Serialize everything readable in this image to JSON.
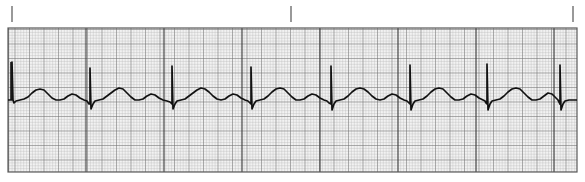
{
  "page": {
    "width": 585,
    "height": 182,
    "background_color": "#ffffff"
  },
  "strip": {
    "label": "ecg-rhythm-strip",
    "grid": {
      "x": 8,
      "y": 28,
      "width": 569,
      "height": 144,
      "paper_color": "#f2f2f2",
      "small_square_px": 2.9,
      "bold_every": 5,
      "minor_line_color": "#b4b4b4",
      "bold_line_color": "#6e6e6e",
      "major_line_color": "#3c3c3c",
      "major_every_px": 78,
      "border_color": "#5a5a5a"
    },
    "interval_ticks": {
      "label": "three-second-interval-ticks",
      "color": "#555555",
      "y_top": 6,
      "y_bottom": 22,
      "x_positions": [
        12,
        291,
        573
      ]
    },
    "trace": {
      "label": "ecg-waveform-trace",
      "color": "#111111",
      "stroke_width": 1.7,
      "baseline_y": 100,
      "calibration_mark": {
        "x": 11,
        "y_top": 62,
        "y_bottom": 100
      }
    }
  },
  "chart_data": {
    "type": "line",
    "xlabel": "Time",
    "ylabel": "Amplitude (mV)",
    "grid": true,
    "legend": null,
    "annotations": [
      "three-second interval ticks at x = 12, 291, 573"
    ],
    "x_range_px": [
      8,
      577
    ],
    "y_range_px": [
      28,
      172
    ],
    "baseline_y_px": 100,
    "beat_count": 8,
    "beat_interval_px": 78,
    "qrs_peak_x_px": [
      12,
      90,
      172,
      251,
      331,
      410,
      487,
      560
    ],
    "beat_template_px": {
      "q_dip_y": 104,
      "r_peak_y": 68,
      "s_trough_y": 109,
      "t_peak_y": 88,
      "u_peak_y": 93,
      "p_peak_y": 96
    },
    "series": [
      {
        "name": "Lead II",
        "points_px": [
          [
            8,
            100
          ],
          [
            9,
            100
          ],
          [
            10,
            100
          ],
          [
            11,
            100
          ],
          [
            12,
            100
          ],
          [
            12,
            62
          ],
          [
            13,
            100
          ],
          [
            14,
            103
          ],
          [
            16,
            101
          ],
          [
            20,
            100
          ],
          [
            24,
            99
          ],
          [
            28,
            97
          ],
          [
            32,
            93
          ],
          [
            36,
            90
          ],
          [
            40,
            89
          ],
          [
            44,
            90
          ],
          [
            48,
            94
          ],
          [
            52,
            98
          ],
          [
            56,
            100
          ],
          [
            60,
            100
          ],
          [
            64,
            99
          ],
          [
            68,
            96
          ],
          [
            72,
            94
          ],
          [
            76,
            95
          ],
          [
            80,
            98
          ],
          [
            84,
            100
          ],
          [
            87,
            101
          ],
          [
            89,
            104
          ],
          [
            90,
            104
          ],
          [
            90,
            68
          ],
          [
            91,
            109
          ],
          [
            93,
            104
          ],
          [
            95,
            101
          ],
          [
            99,
            100
          ],
          [
            103,
            99
          ],
          [
            107,
            96
          ],
          [
            111,
            93
          ],
          [
            115,
            90
          ],
          [
            119,
            88
          ],
          [
            123,
            89
          ],
          [
            127,
            93
          ],
          [
            131,
            97
          ],
          [
            135,
            100
          ],
          [
            139,
            100
          ],
          [
            143,
            99
          ],
          [
            147,
            96
          ],
          [
            151,
            94
          ],
          [
            155,
            95
          ],
          [
            159,
            98
          ],
          [
            163,
            100
          ],
          [
            167,
            101
          ],
          [
            170,
            102
          ],
          [
            172,
            104
          ],
          [
            172,
            66
          ],
          [
            173,
            109
          ],
          [
            175,
            104
          ],
          [
            177,
            101
          ],
          [
            181,
            100
          ],
          [
            185,
            99
          ],
          [
            189,
            96
          ],
          [
            193,
            93
          ],
          [
            197,
            90
          ],
          [
            201,
            88
          ],
          [
            205,
            89
          ],
          [
            209,
            92
          ],
          [
            213,
            96
          ],
          [
            217,
            99
          ],
          [
            221,
            100
          ],
          [
            225,
            99
          ],
          [
            229,
            96
          ],
          [
            233,
            94
          ],
          [
            237,
            95
          ],
          [
            241,
            98
          ],
          [
            245,
            100
          ],
          [
            248,
            101
          ],
          [
            250,
            103
          ],
          [
            251,
            104
          ],
          [
            251,
            67
          ],
          [
            252,
            109
          ],
          [
            254,
            104
          ],
          [
            256,
            101
          ],
          [
            260,
            100
          ],
          [
            264,
            99
          ],
          [
            268,
            96
          ],
          [
            272,
            92
          ],
          [
            276,
            89
          ],
          [
            280,
            88
          ],
          [
            284,
            89
          ],
          [
            288,
            93
          ],
          [
            292,
            97
          ],
          [
            296,
            100
          ],
          [
            300,
            100
          ],
          [
            304,
            99
          ],
          [
            308,
            96
          ],
          [
            312,
            94
          ],
          [
            316,
            95
          ],
          [
            320,
            98
          ],
          [
            324,
            100
          ],
          [
            327,
            101
          ],
          [
            329,
            103
          ],
          [
            331,
            104
          ],
          [
            331,
            66
          ],
          [
            332,
            110
          ],
          [
            334,
            104
          ],
          [
            336,
            101
          ],
          [
            340,
            100
          ],
          [
            344,
            99
          ],
          [
            348,
            96
          ],
          [
            352,
            92
          ],
          [
            356,
            89
          ],
          [
            360,
            88
          ],
          [
            364,
            89
          ],
          [
            368,
            92
          ],
          [
            372,
            96
          ],
          [
            376,
            99
          ],
          [
            380,
            100
          ],
          [
            384,
            99
          ],
          [
            388,
            96
          ],
          [
            392,
            94
          ],
          [
            396,
            95
          ],
          [
            400,
            98
          ],
          [
            404,
            100
          ],
          [
            407,
            101
          ],
          [
            409,
            103
          ],
          [
            410,
            104
          ],
          [
            410,
            65
          ],
          [
            411,
            110
          ],
          [
            413,
            104
          ],
          [
            415,
            101
          ],
          [
            419,
            100
          ],
          [
            423,
            99
          ],
          [
            427,
            96
          ],
          [
            431,
            92
          ],
          [
            435,
            89
          ],
          [
            439,
            88
          ],
          [
            443,
            89
          ],
          [
            447,
            93
          ],
          [
            451,
            97
          ],
          [
            455,
            100
          ],
          [
            459,
            100
          ],
          [
            463,
            99
          ],
          [
            467,
            96
          ],
          [
            471,
            94
          ],
          [
            475,
            95
          ],
          [
            479,
            98
          ],
          [
            483,
            100
          ],
          [
            485,
            101
          ],
          [
            486,
            103
          ],
          [
            487,
            104
          ],
          [
            487,
            64
          ],
          [
            488,
            110
          ],
          [
            490,
            104
          ],
          [
            492,
            101
          ],
          [
            496,
            100
          ],
          [
            500,
            99
          ],
          [
            504,
            96
          ],
          [
            508,
            92
          ],
          [
            512,
            89
          ],
          [
            516,
            88
          ],
          [
            520,
            89
          ],
          [
            524,
            93
          ],
          [
            528,
            97
          ],
          [
            532,
            100
          ],
          [
            536,
            100
          ],
          [
            540,
            99
          ],
          [
            544,
            96
          ],
          [
            548,
            93
          ],
          [
            552,
            94
          ],
          [
            556,
            98
          ],
          [
            558,
            100
          ],
          [
            559,
            102
          ],
          [
            560,
            104
          ],
          [
            560,
            65
          ],
          [
            561,
            110
          ],
          [
            563,
            104
          ],
          [
            565,
            101
          ],
          [
            569,
            100
          ],
          [
            573,
            100
          ],
          [
            577,
            100
          ]
        ]
      }
    ]
  }
}
